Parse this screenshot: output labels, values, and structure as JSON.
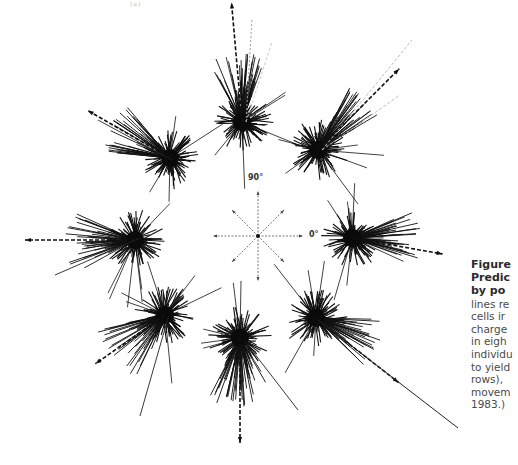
{
  "figure": {
    "top_fragment": "(a)",
    "compass": {
      "center": [
        258,
        236
      ],
      "radius": 45,
      "label_90": "90°",
      "label_0": "0°"
    },
    "clusters": [
      {
        "id": "N",
        "center": [
          242,
          122
        ],
        "pred_angle": 95,
        "pred_len": 120,
        "dense": 45,
        "long_dir": [
          70,
          120
        ],
        "color": "#111111"
      },
      {
        "id": "NE",
        "center": [
          318,
          150
        ],
        "pred_angle": 45,
        "pred_len": 115,
        "dense": 45,
        "long_dir": [
          30,
          65
        ],
        "color": "#111111"
      },
      {
        "id": "E",
        "center": [
          352,
          238
        ],
        "pred_angle": -10,
        "pred_len": 92,
        "dense": 40,
        "long_dir": [
          -20,
          25
        ],
        "color": "#111111"
      },
      {
        "id": "SE",
        "center": [
          316,
          318
        ],
        "pred_angle": -38,
        "pred_len": 105,
        "dense": 40,
        "long_dir": [
          -45,
          0
        ],
        "color": "#111111"
      },
      {
        "id": "S",
        "center": [
          240,
          338
        ],
        "pred_angle": -90,
        "pred_len": 105,
        "dense": 45,
        "long_dir": [
          -120,
          -60
        ],
        "color": "#111111"
      },
      {
        "id": "SW",
        "center": [
          165,
          315
        ],
        "pred_angle": -145,
        "pred_len": 85,
        "dense": 40,
        "long_dir": [
          -170,
          -110
        ],
        "color": "#111111"
      },
      {
        "id": "W",
        "center": [
          135,
          240
        ],
        "pred_angle": 180,
        "pred_len": 110,
        "dense": 40,
        "long_dir": [
          155,
          210
        ],
        "color": "#111111"
      },
      {
        "id": "NW",
        "center": [
          170,
          158
        ],
        "pred_angle": 150,
        "pred_len": 95,
        "dense": 40,
        "long_dir": [
          130,
          175
        ],
        "color": "#111111"
      }
    ]
  },
  "caption": {
    "title_lines": [
      "Figure",
      "Predic",
      "by po"
    ],
    "body_lines": [
      "lines re",
      "cells ir",
      "charge",
      "in eigh",
      "individu",
      "to yield",
      "rows),",
      "movem",
      "1983.)"
    ]
  }
}
